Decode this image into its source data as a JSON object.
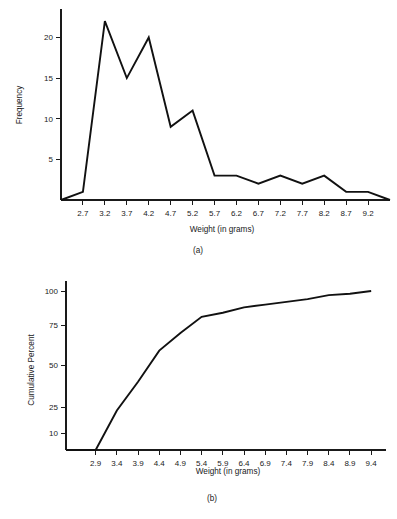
{
  "figure": {
    "panel_a_caption": "(a)",
    "panel_b_caption": "(b)",
    "line_color": "#111111",
    "axis_color": "#1a1a1a",
    "background": "#ffffff"
  },
  "chart_data": [
    {
      "type": "line",
      "panel": "(a)",
      "title": "",
      "xlabel": "Weight (in grams)",
      "ylabel": "Frequency",
      "x": [
        2.2,
        2.7,
        3.2,
        3.7,
        4.2,
        4.7,
        5.2,
        5.7,
        6.2,
        6.7,
        7.2,
        7.7,
        8.2,
        8.7,
        9.2,
        9.7
      ],
      "values": [
        0,
        1,
        22,
        15,
        20,
        9,
        11,
        3,
        3,
        2,
        3,
        2,
        3,
        1,
        1,
        0
      ],
      "xticks": [
        2.7,
        3.2,
        3.7,
        4.2,
        4.7,
        5.2,
        5.7,
        6.2,
        6.7,
        7.2,
        7.7,
        8.2,
        8.7,
        9.2
      ],
      "xticklabels": [
        "2.7",
        "3.2",
        "3.7",
        "4.2",
        "4.7",
        "5.2",
        "5.7",
        "6.2",
        "6.7",
        "7.2",
        "7.7",
        "8.2",
        "8.7",
        "9.2"
      ],
      "yticks": [
        5,
        10,
        15,
        20
      ],
      "yticklabels": [
        "5",
        "10",
        "15",
        "20"
      ],
      "xlim": [
        2.2,
        9.7
      ],
      "ylim": [
        0,
        23.5
      ],
      "grid": false,
      "legend": false
    },
    {
      "type": "line",
      "panel": "(b)",
      "title": "",
      "xlabel": "Weight (in grams)",
      "ylabel": "Cumulative Percent",
      "x": [
        2.2,
        2.9,
        3.4,
        3.9,
        4.4,
        4.9,
        5.4,
        5.9,
        6.4,
        6.9,
        7.4,
        7.9,
        8.4,
        8.9,
        9.4
      ],
      "values": [
        0,
        0,
        23,
        40,
        59,
        70,
        81,
        84,
        88,
        90,
        92,
        94,
        97,
        98,
        100
      ],
      "xticks": [
        2.9,
        3.4,
        3.9,
        4.4,
        4.9,
        5.4,
        5.9,
        6.4,
        6.9,
        7.4,
        7.9,
        8.4,
        8.9,
        9.4
      ],
      "xticklabels": [
        "2.9",
        "3.4",
        "3.9",
        "4.4",
        "4.9",
        "5.4",
        "5.9",
        "6.4",
        "6.9",
        "7.4",
        "7.9",
        "8.4",
        "8.9",
        "9.4"
      ],
      "yticks": [
        10,
        25,
        50,
        75,
        100
      ],
      "yticklabels": [
        "10",
        "25",
        "50",
        "75",
        "100"
      ],
      "ytick_positions": [
        433,
        407,
        365,
        325,
        291
      ],
      "xlim": [
        2.2,
        9.75
      ],
      "ylim": [
        0,
        100
      ],
      "scale": "probability",
      "grid": false,
      "legend": false
    }
  ]
}
